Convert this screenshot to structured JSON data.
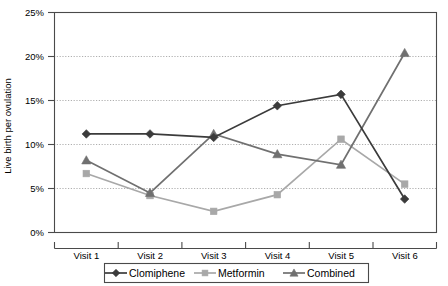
{
  "chart_data": {
    "type": "line",
    "title": "",
    "xlabel": "",
    "ylabel": "Live birth per ovulation",
    "categories": [
      "Visit 1",
      "Visit 2",
      "Visit 3",
      "Visit 4",
      "Visit 5",
      "Visit 6"
    ],
    "ylim": [
      0,
      25
    ],
    "ytick_labels": [
      "0%",
      "5%",
      "10%",
      "15%",
      "20%",
      "25%"
    ],
    "ytick_values": [
      0,
      5,
      10,
      15,
      20,
      25
    ],
    "grid": true,
    "legend_position": "bottom",
    "series": [
      {
        "name": "Clomiphene",
        "marker": "diamond",
        "color": "#3b3b3b",
        "values": [
          11.2,
          11.2,
          10.8,
          14.4,
          15.7,
          3.8
        ]
      },
      {
        "name": "Metformin",
        "marker": "square",
        "color": "#a8a8a8",
        "values": [
          6.7,
          4.2,
          2.4,
          4.3,
          10.6,
          5.5
        ]
      },
      {
        "name": "Combined",
        "marker": "triangle",
        "color": "#707070",
        "values": [
          8.2,
          4.5,
          11.2,
          8.9,
          7.7,
          20.4
        ]
      }
    ]
  },
  "axis": {
    "y_title": "Live birth per ovulation",
    "y_ticks": [
      {
        "label": "25%",
        "value": 25
      },
      {
        "label": "20%",
        "value": 20
      },
      {
        "label": "15%",
        "value": 15
      },
      {
        "label": "10%",
        "value": 10
      },
      {
        "label": "5%",
        "value": 5
      },
      {
        "label": "0%",
        "value": 0
      }
    ],
    "x_ticks": [
      {
        "label": "Visit 1"
      },
      {
        "label": "Visit 2"
      },
      {
        "label": "Visit 3"
      },
      {
        "label": "Visit 4"
      },
      {
        "label": "Visit 5"
      },
      {
        "label": "Visit 6"
      }
    ]
  },
  "legend": {
    "items": [
      {
        "label": "Clomiphene",
        "marker": "diamond",
        "color": "#3b3b3b"
      },
      {
        "label": "Metformin",
        "marker": "square",
        "color": "#a8a8a8"
      },
      {
        "label": "Combined",
        "marker": "triangle",
        "color": "#707070"
      }
    ]
  }
}
